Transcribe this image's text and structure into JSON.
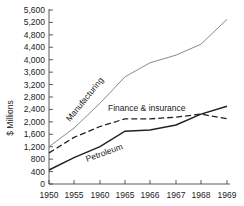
{
  "chart_data": {
    "type": "line",
    "title": "",
    "xlabel": "",
    "ylabel": "$ Millions",
    "categories": [
      "1950",
      "1955",
      "1960",
      "1965",
      "1966",
      "1967",
      "1968",
      "1969"
    ],
    "ylim": [
      0,
      5600
    ],
    "yticks": [
      0,
      400,
      800,
      1200,
      1600,
      2000,
      2400,
      2800,
      3200,
      3600,
      4000,
      4400,
      4800,
      5200,
      5600
    ],
    "ytick_labels": [
      "0",
      "400",
      "800",
      "1,200",
      "1,600",
      "2,000",
      "2,400",
      "2,800",
      "3,200",
      "3,600",
      "4,000",
      "4,400",
      "4,800",
      "5,200",
      "5,600"
    ],
    "grid": false,
    "legend": "inline labels on lines",
    "series": [
      {
        "name": "Manufacturing",
        "style": "solid-thin",
        "color": "#888888",
        "values": [
          1200,
          1800,
          2600,
          3450,
          3900,
          4150,
          4500,
          5300
        ]
      },
      {
        "name": "Finance & insurance",
        "style": "dashed",
        "color": "#222222",
        "values": [
          1000,
          1500,
          1850,
          2100,
          2100,
          2150,
          2250,
          2100
        ]
      },
      {
        "name": "Petroleum",
        "style": "solid-thick",
        "color": "#222222",
        "values": [
          450,
          850,
          1200,
          1700,
          1740,
          1900,
          2250,
          2500
        ]
      }
    ]
  }
}
